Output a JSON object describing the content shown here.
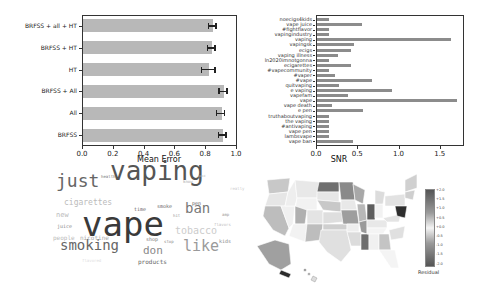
{
  "chart_data": [
    {
      "type": "bar",
      "orientation": "horizontal",
      "title": "",
      "xlabel": "Mean Error",
      "ylabel": "",
      "xlim": [
        0.0,
        1.0
      ],
      "xticks": [
        "0.0",
        "0.2",
        "0.4",
        "0.6",
        "0.8",
        "1.0"
      ],
      "categories": [
        "BRFSS + all + HT",
        "BRFSS + HT",
        "HT",
        "BRFSS + All",
        "All",
        "BRFSS"
      ],
      "values": [
        0.845,
        0.84,
        0.82,
        0.915,
        0.9,
        0.91
      ],
      "errors": [
        0.03,
        0.03,
        0.05,
        0.03,
        0.03,
        0.03
      ],
      "bar_color": "#b8b8b8"
    },
    {
      "type": "bar",
      "orientation": "horizontal",
      "title": "",
      "xlabel": "SNR",
      "ylabel": "",
      "xlim": [
        0.0,
        1.78
      ],
      "xticks": [
        "0.0",
        "0.5",
        "1.0",
        "1.5"
      ],
      "categories": [
        "noecigs4kids",
        "vape juice",
        "#fightflavor",
        "vapingindustry",
        "vaping",
        "vapingsk",
        "ecigs",
        "vaping illness",
        "ln2020imnotgonna",
        "ecigarettes",
        "#vapecommunity",
        "#vaper",
        "#vape",
        "quitvaping",
        "e vaping",
        "vapefam",
        "vape",
        "vape death",
        "e pen",
        "truthaboutvaping",
        "the vaping",
        "#antivaping",
        "vape pen",
        "lambsvape",
        "vape ban"
      ],
      "values": [
        0.15,
        0.55,
        0.15,
        0.15,
        1.62,
        0.45,
        0.41,
        0.26,
        0.15,
        0.41,
        0.15,
        0.22,
        0.67,
        0.27,
        0.91,
        0.37,
        1.7,
        0.18,
        0.56,
        0.15,
        0.15,
        0.15,
        0.15,
        0.15,
        0.44
      ],
      "bar_color": "#8c8c8c"
    },
    {
      "type": "wordcloud",
      "words": [
        {
          "text": "vape",
          "size": 34,
          "x": 82,
          "y": 236,
          "color": "#3a3a3a"
        },
        {
          "text": "vaping",
          "size": 26,
          "x": 110,
          "y": 180,
          "color": "#555555"
        },
        {
          "text": "just",
          "size": 18,
          "x": 56,
          "y": 187,
          "color": "#666666"
        },
        {
          "text": "smoking",
          "size": 14,
          "x": 60,
          "y": 250,
          "color": "#666666"
        },
        {
          "text": "like",
          "size": 15,
          "x": 183,
          "y": 252,
          "color": "#9a9a9a"
        },
        {
          "text": "ban",
          "size": 14,
          "x": 185,
          "y": 213,
          "color": "#777777"
        },
        {
          "text": "tobacco",
          "size": 10,
          "x": 175,
          "y": 234,
          "color": "#cccccc"
        },
        {
          "text": "don",
          "size": 11,
          "x": 143,
          "y": 254,
          "color": "#888888"
        },
        {
          "text": "cigarettes",
          "size": 8,
          "x": 64,
          "y": 206,
          "color": "#bbbbbb"
        },
        {
          "text": "products",
          "size": 6,
          "x": 138,
          "y": 264,
          "color": "#666666"
        },
        {
          "text": "smoke",
          "size": 5,
          "x": 157,
          "y": 208,
          "color": "#666666"
        },
        {
          "text": "time",
          "size": 5,
          "x": 134,
          "y": 211,
          "color": "#666666"
        },
        {
          "text": "pen",
          "size": 5,
          "x": 192,
          "y": 205,
          "color": "#666666"
        },
        {
          "text": "new",
          "size": 7,
          "x": 56,
          "y": 218,
          "color": "#bbbbbb"
        },
        {
          "text": "juice",
          "size": 5,
          "x": 57,
          "y": 228,
          "color": "#888888"
        },
        {
          "text": "people",
          "size": 6,
          "x": 53,
          "y": 240,
          "color": "#bbbbbb"
        },
        {
          "text": "nicotine",
          "size": 6,
          "x": 80,
          "y": 240,
          "color": "#aaaaaa"
        },
        {
          "text": "shop",
          "size": 5,
          "x": 146,
          "y": 241,
          "color": "#777777"
        },
        {
          "text": "stop",
          "size": 4,
          "x": 164,
          "y": 243,
          "color": "#888888"
        },
        {
          "text": "kids",
          "size": 5,
          "x": 219,
          "y": 243,
          "color": "#888888"
        },
        {
          "text": "flavors",
          "size": 4,
          "x": 214,
          "y": 226,
          "color": "#bbbbbb"
        },
        {
          "text": "amp",
          "size": 4,
          "x": 222,
          "y": 216,
          "color": "#999999"
        },
        {
          "text": "health",
          "size": 4,
          "x": 101,
          "y": 178,
          "color": "#777777"
        },
        {
          "text": "hit",
          "size": 4,
          "x": 173,
          "y": 217,
          "color": "#999999"
        },
        {
          "text": "know",
          "size": 4,
          "x": 183,
          "y": 183,
          "color": "#aaaaaa"
        },
        {
          "text": "really",
          "size": 4,
          "x": 230,
          "y": 190,
          "color": "#cccccc"
        },
        {
          "text": "good",
          "size": 3,
          "x": 198,
          "y": 178,
          "color": "#bbbbbb"
        },
        {
          "text": "flavored",
          "size": 4,
          "x": 82,
          "y": 262,
          "color": "#dddddd"
        }
      ]
    },
    {
      "type": "choropleth",
      "title": "",
      "colorbar_label": "Residual",
      "colorbar_ticks": [
        "+2.0",
        "+1.5",
        "+1.0",
        "+0.5",
        "+0.0",
        "-0.5",
        "-1.0",
        "-1.5",
        "-2.0"
      ]
    }
  ],
  "panels": {
    "left_xlabel": "Mean Error",
    "right_xlabel": "SNR",
    "colorbar_label": "Residual"
  }
}
